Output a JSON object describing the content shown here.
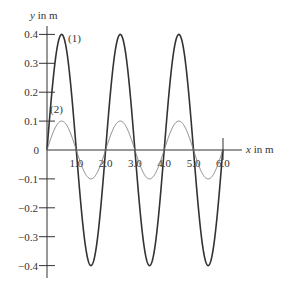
{
  "chart_data": {
    "type": "line",
    "title": "",
    "xlabel": "x in m",
    "ylabel": "y in m",
    "xlim": [
      0,
      6.0
    ],
    "ylim": [
      -0.4,
      0.4
    ],
    "grid": false,
    "x_ticks": [
      1.0,
      2.0,
      3.0,
      4.0,
      5.0,
      6.0
    ],
    "x_tick_labels": [
      "1.0",
      "2.0",
      "3.0",
      "4.0",
      "5.0",
      "6.0"
    ],
    "y_ticks": [
      0.4,
      0.3,
      0.2,
      0.1,
      0,
      -0.1,
      -0.2,
      -0.3,
      -0.4
    ],
    "y_tick_labels": [
      "0.4",
      "0.3",
      "0.2",
      "0.1",
      "0",
      "−0.1",
      "−0.2",
      "−0.3",
      "−0.4"
    ],
    "series": [
      {
        "name": "(1)",
        "amplitude": 0.4,
        "wavelength": 2.0,
        "x": [
          0,
          0.5,
          1.0,
          1.5,
          2.0,
          2.5,
          3.0,
          3.5,
          4.0,
          4.5,
          5.0,
          5.5,
          6.0
        ],
        "values": [
          0,
          0.4,
          0,
          -0.4,
          0,
          0.4,
          0,
          -0.4,
          0,
          0.4,
          0,
          -0.4,
          0
        ],
        "color": "#333333",
        "line_width": 1.6
      },
      {
        "name": "(2)",
        "amplitude": 0.1,
        "wavelength": 2.0,
        "x": [
          0,
          0.5,
          1.0,
          1.5,
          2.0,
          2.5,
          3.0,
          3.5,
          4.0,
          4.5,
          5.0,
          5.5,
          6.0
        ],
        "values": [
          0,
          0.1,
          0,
          -0.1,
          0,
          0.1,
          0,
          -0.1,
          0,
          0.1,
          0,
          -0.1,
          0
        ],
        "color": "#777777",
        "line_width": 0.9
      }
    ],
    "annotations": [
      {
        "text": "(1)",
        "near_x": 0.5,
        "near_y": 0.4
      },
      {
        "text": "(2)",
        "near_x": 0.4,
        "near_y": 0.14
      }
    ]
  },
  "labels": {
    "y_axis": "y in m",
    "x_axis": "x in m",
    "series1": "(1)",
    "series2": "(2)"
  }
}
